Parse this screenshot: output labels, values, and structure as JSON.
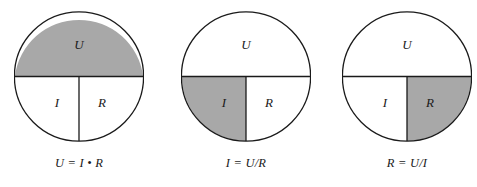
{
  "figure": {
    "background_color": "#ffffff",
    "stroke_color": "#1a1a1a",
    "shade_color": "#a8a8a8",
    "unshaded_color": "#ffffff"
  },
  "diagrams": [
    {
      "id": "voltage",
      "shaded_region": "U",
      "labels": {
        "top": "U",
        "bottom_left": "I",
        "bottom_right": "R"
      },
      "caption": "U = I • R",
      "center_x": 79
    },
    {
      "id": "current",
      "shaded_region": "I",
      "labels": {
        "top": "U",
        "bottom_left": "I",
        "bottom_right": "R"
      },
      "caption": "I = U/R",
      "center_x": 246
    },
    {
      "id": "resistance",
      "shaded_region": "R",
      "labels": {
        "top": "U",
        "bottom_left": "I",
        "bottom_right": "R"
      },
      "caption": "R = U/I",
      "center_x": 406
    }
  ]
}
